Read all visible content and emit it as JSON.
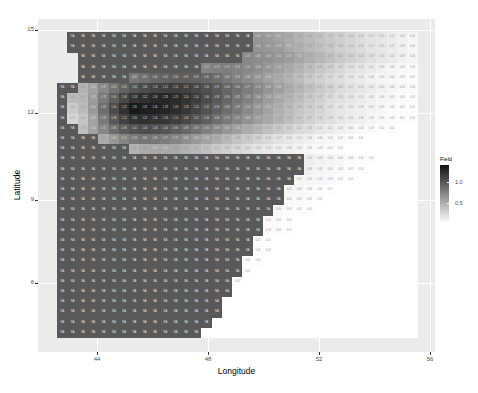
{
  "chart_data": {
    "type": "heatmap",
    "title": "",
    "xlabel": "Longitude",
    "ylabel": "Latitude",
    "x_ticks": [
      44,
      48,
      52,
      56
    ],
    "y_ticks": [
      6,
      9,
      12,
      15
    ],
    "xlim": [
      42.2,
      56.2
    ],
    "ylim": [
      2.4,
      15.3
    ],
    "legend": {
      "title": "Field",
      "ticks": [
        1.0,
        0.5
      ],
      "tick_labels": [
        "1.0",
        "0.5"
      ],
      "range": [
        0.0,
        1.4
      ],
      "colors": [
        "#111111",
        "#ffffff"
      ]
    },
    "na_label": "NA",
    "na_color": "#595959",
    "grid": {
      "x0": 57,
      "y0": 32,
      "cell_w": 10.3,
      "cell_h": 10.2,
      "cols": 35,
      "rows": 30
    },
    "rows_note": "Per row: na=[start,end) NA-cell column range; vals = numeric grayscale values starting at val_start column (values 0-1.4, '.' = blank)",
    "rows": [
      {
        "na": [
          1,
          19
        ],
        "val_start": 19,
        "vals": [
          0.62,
          0.6,
          0.55,
          0.5,
          0.45,
          0.4,
          0.36,
          0.32,
          0.28,
          0.24,
          0.2,
          0.17,
          0.14,
          0.11,
          0.08,
          0.06
        ]
      },
      {
        "na": [
          1,
          19
        ],
        "val_start": 19,
        "vals": [
          0.64,
          0.62,
          0.58,
          0.52,
          0.47,
          0.42,
          0.37,
          0.33,
          0.28,
          0.24,
          0.2,
          0.17,
          0.14,
          0.11,
          0.08,
          0.06
        ]
      },
      {
        "na": [
          2,
          18
        ],
        "val_start": 18,
        "vals": [
          0.7,
          0.68,
          0.66,
          0.62,
          0.58,
          0.52,
          0.47,
          0.42,
          0.37,
          0.32,
          0.27,
          0.23,
          0.19,
          0.15,
          0.12,
          0.09,
          0.06
        ]
      },
      {
        "na": [
          2,
          14
        ],
        "val_start": 14,
        "vals": [
          0.72,
          0.75,
          0.76,
          0.74,
          0.7,
          0.66,
          0.62,
          0.56,
          0.5,
          0.44,
          0.38,
          0.33,
          0.28,
          0.23,
          0.19,
          0.15,
          0.12,
          0.09,
          0.06,
          0.04,
          0.03
        ]
      },
      {
        "na": [
          2,
          7
        ],
        "val_start": 7,
        "vals": [
          0.8,
          0.85,
          0.9,
          0.92,
          0.94,
          0.95,
          0.93,
          0.9,
          0.86,
          0.8,
          0.74,
          0.68,
          0.62,
          0.56,
          0.5,
          0.44,
          0.38,
          0.32,
          0.27,
          0.22,
          0.18,
          0.14,
          0.11,
          0.08,
          0.06,
          0.04,
          0.03,
          0.02
        ]
      },
      {
        "na": [
          0,
          2
        ],
        "val_start": 2,
        "vals": [
          0.45,
          0.55,
          0.7,
          0.82,
          0.92,
          1.0,
          1.06,
          1.1,
          1.12,
          1.13,
          1.12,
          1.08,
          1.03,
          0.97,
          0.9,
          0.84,
          0.77,
          0.7,
          0.63,
          0.56,
          0.49,
          0.43,
          0.37,
          0.31,
          0.26,
          0.21,
          0.17,
          0.14,
          0.11,
          0.08,
          0.06,
          0.04,
          0.03
        ]
      },
      {
        "na": [
          0,
          1
        ],
        "val_start": 1,
        "vals": [
          0.4,
          0.42,
          0.58,
          0.78,
          0.95,
          1.08,
          1.18,
          1.22,
          1.26,
          1.28,
          1.25,
          1.2,
          1.14,
          1.06,
          0.98,
          0.9,
          0.82,
          0.74,
          0.66,
          0.58,
          0.51,
          0.44,
          0.38,
          0.32,
          0.27,
          0.22,
          0.18,
          0.14,
          0.11,
          0.08,
          0.06,
          0.04,
          0.03,
          0.02
        ]
      },
      {
        "na": [
          0,
          1
        ],
        "val_start": 1,
        "vals": [
          0.3,
          0.4,
          0.6,
          0.85,
          1.05,
          1.22,
          1.35,
          1.32,
          1.3,
          1.28,
          1.24,
          1.18,
          1.1,
          1.02,
          0.94,
          0.86,
          0.78,
          0.7,
          0.62,
          0.54,
          0.47,
          0.4,
          0.34,
          0.29,
          0.24,
          0.19,
          0.15,
          0.12,
          0.09,
          0.07,
          0.05,
          0.03,
          0.02,
          0.01
        ]
      },
      {
        "na": [
          0,
          1
        ],
        "val_start": 1,
        "vals": [
          0.25,
          0.35,
          0.55,
          0.78,
          0.98,
          1.12,
          1.2,
          1.22,
          1.2,
          1.18,
          1.14,
          1.08,
          1.01,
          0.94,
          0.86,
          0.79,
          0.71,
          0.64,
          0.57,
          0.5,
          0.44,
          0.38,
          0.32,
          0.27,
          0.22,
          0.18,
          0.14,
          0.11,
          0.08,
          0.06,
          0.04,
          0.03,
          0.02,
          0.01
        ]
      },
      {
        "na": [
          0,
          2
        ],
        "val_start": 2,
        "vals": [
          0.38,
          0.55,
          0.72,
          0.86,
          0.96,
          1.02,
          1.04,
          1.03,
          1.0,
          0.95,
          0.89,
          0.83,
          0.76,
          0.69,
          0.62,
          0.56,
          0.49,
          0.43,
          0.37,
          0.32,
          0.27,
          0.22,
          0.18,
          0.14,
          0.11,
          0.08,
          0.06,
          0.04,
          0.03,
          0.02,
          0.01
        ]
      },
      {
        "na": [
          0,
          4
        ],
        "val_start": 4,
        "vals": [
          0.5,
          0.62,
          0.72,
          0.78,
          0.81,
          0.8,
          0.77,
          0.72,
          0.66,
          0.6,
          0.54,
          0.48,
          0.42,
          0.36,
          0.31,
          0.26,
          0.21,
          0.17,
          0.14,
          0.11,
          0.08,
          0.06,
          0.04,
          0.03,
          0.02,
          0.01
        ]
      },
      {
        "na": [
          0,
          7
        ],
        "val_start": 7,
        "vals": [
          0.45,
          0.5,
          0.52,
          0.52,
          0.5,
          0.46,
          0.42,
          0.37,
          0.32,
          0.28,
          0.24,
          0.2,
          0.16,
          0.13,
          0.1,
          0.08,
          0.06,
          0.04,
          0.03,
          0.02,
          0.01
        ]
      },
      {
        "na": [
          0,
          24
        ],
        "val_start": 24,
        "vals": [
          0.1,
          0.08,
          0.06,
          0.04,
          0.03,
          0.02,
          0.01
        ]
      },
      {
        "na": [
          0,
          24
        ],
        "val_start": 24,
        "vals": [
          0.08,
          0.06,
          0.04,
          0.03,
          0.02,
          0.01
        ]
      },
      {
        "na": [
          0,
          23
        ],
        "val_start": 23,
        "vals": [
          0.06,
          0.05,
          0.04,
          0.03,
          0.02,
          0.01
        ]
      },
      {
        "na": [
          0,
          22
        ],
        "val_start": 22,
        "vals": [
          0.05,
          0.04,
          0.03,
          0.02,
          0.01
        ]
      },
      {
        "na": [
          0,
          22
        ],
        "val_start": 22,
        "vals": [
          0.04,
          0.03,
          0.02,
          0.01
        ]
      },
      {
        "na": [
          0,
          21
        ],
        "val_start": 21,
        "vals": [
          0.04,
          0.03,
          0.02,
          0.01
        ]
      },
      {
        "na": [
          0,
          20
        ],
        "val_start": 20,
        "vals": [
          0.03,
          0.02,
          0.01
        ]
      },
      {
        "na": [
          0,
          20
        ],
        "val_start": 20,
        "vals": [
          0.03,
          0.02,
          0.01
        ]
      },
      {
        "na": [
          0,
          19
        ],
        "val_start": 19,
        "vals": [
          0.02,
          0.01
        ]
      },
      {
        "na": [
          0,
          19
        ],
        "val_start": 19,
        "vals": [
          0.02,
          0.01
        ]
      },
      {
        "na": [
          0,
          18
        ],
        "val_start": 18,
        "vals": [
          0.02,
          0.01
        ]
      },
      {
        "na": [
          0,
          18
        ],
        "val_start": 18,
        "vals": [
          0.01
        ]
      },
      {
        "na": [
          0,
          17
        ],
        "val_start": 17,
        "vals": [
          0.01
        ]
      },
      {
        "na": [
          0,
          17
        ],
        "val_start": 17,
        "vals": []
      },
      {
        "na": [
          0,
          16
        ],
        "val_start": 16,
        "vals": []
      },
      {
        "na": [
          0,
          16
        ],
        "val_start": 16,
        "vals": []
      },
      {
        "na": [
          0,
          15
        ],
        "val_start": 15,
        "vals": []
      },
      {
        "na": [
          0,
          14
        ],
        "val_start": 14,
        "vals": []
      }
    ]
  },
  "axes": {
    "xlabel": "Longitude",
    "ylabel": "Latitude",
    "x_tick_labels": [
      "44",
      "48",
      "52",
      "56"
    ],
    "y_tick_labels": [
      "15",
      "12",
      "9",
      "6"
    ]
  },
  "legend": {
    "title": "Field",
    "tick_1": "1.0",
    "tick_2": "0.5"
  }
}
